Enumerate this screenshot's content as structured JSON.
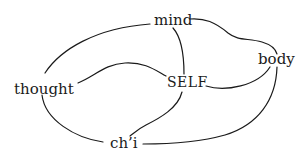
{
  "diagram": {
    "nodes": [
      {
        "id": "mind",
        "label": "mind"
      },
      {
        "id": "body",
        "label": "body"
      },
      {
        "id": "self",
        "label": "SELF"
      },
      {
        "id": "thought",
        "label": "thought"
      },
      {
        "id": "chi",
        "label": "ch’i"
      }
    ],
    "edges": [
      {
        "from": "thought",
        "to": "mind"
      },
      {
        "from": "mind",
        "to": "body"
      },
      {
        "from": "mind",
        "to": "self"
      },
      {
        "from": "thought",
        "to": "self"
      },
      {
        "from": "self",
        "to": "body"
      },
      {
        "from": "body",
        "to": "chi"
      },
      {
        "from": "thought",
        "to": "chi"
      },
      {
        "from": "self",
        "to": "chi"
      }
    ],
    "line_color": "#1a1a1a"
  }
}
